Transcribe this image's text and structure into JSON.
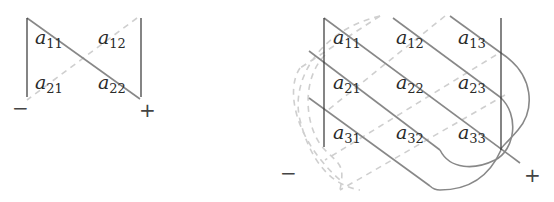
{
  "diagram": {
    "title": "",
    "matrix2x2": {
      "entries": [
        {
          "base": "a",
          "sub": "11"
        },
        {
          "base": "a",
          "sub": "12"
        },
        {
          "base": "a",
          "sub": "21"
        },
        {
          "base": "a",
          "sub": "22"
        }
      ],
      "minus_label": "−",
      "plus_label": "+"
    },
    "matrix3x3": {
      "entries": [
        {
          "base": "a",
          "sub": "11"
        },
        {
          "base": "a",
          "sub": "12"
        },
        {
          "base": "a",
          "sub": "13"
        },
        {
          "base": "a",
          "sub": "21"
        },
        {
          "base": "a",
          "sub": "22"
        },
        {
          "base": "a",
          "sub": "23"
        },
        {
          "base": "a",
          "sub": "31"
        },
        {
          "base": "a",
          "sub": "32"
        },
        {
          "base": "a",
          "sub": "33"
        }
      ],
      "minus_label": "−",
      "plus_label": "+"
    },
    "colors": {
      "positive_diagonal": "#888888",
      "negative_diagonal": "#cfcfcf",
      "bars": "#333333"
    }
  }
}
